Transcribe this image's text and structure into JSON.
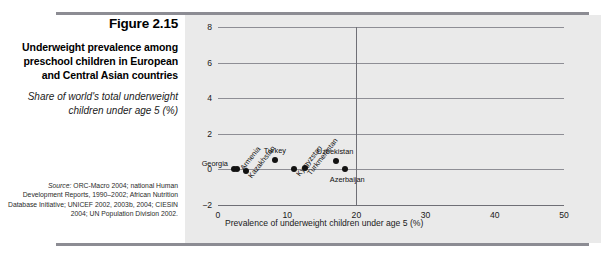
{
  "figure": {
    "number": "Figure 2.15",
    "title": "Underweight prevalence among preschool children in European and Central Asian countries",
    "subtitle": "Share of world's total underweight children under age 5 (%)",
    "source_lead": "Source:",
    "source_body": " ORC-Macro 2004; national Human Development Reports, 1990–2002; African Nutrition Database Initiative; UNICEF 2002, 2003b, 2004; CIESIN 2004; UN Population Division 2002."
  },
  "colors": {
    "rule": "#8c8c93",
    "panel_background": "#eaeaea",
    "page_background": "#ffffff",
    "gridline": "#8e8e95",
    "axis": "#6f6f76",
    "marker": "#111111"
  },
  "chart_data": {
    "type": "scatter",
    "title": "",
    "xlabel": "Prevalence of underweight children under age 5 (%)",
    "ylabel": "",
    "xlim": [
      0,
      50
    ],
    "ylim": [
      -2,
      8
    ],
    "xticks": [
      "0",
      "10",
      "20",
      "30",
      "40",
      "50"
    ],
    "yticks": [
      "8",
      "6",
      "4",
      "2",
      "0",
      "-2"
    ],
    "grid": true,
    "legend": "none",
    "reference_line_x": 20,
    "points": [
      {
        "label": "Georgia",
        "x": 2.3,
        "y": 0.0,
        "label_pos": "left",
        "rotation": 0
      },
      {
        "label": "Armenia",
        "x": 2.8,
        "y": 0.05,
        "label_pos": "diag-up",
        "rotation": -52
      },
      {
        "label": "Kazakhstan",
        "x": 4.0,
        "y": -0.1,
        "label_pos": "diag-down",
        "rotation": -52
      },
      {
        "label": "Turkey",
        "x": 8.3,
        "y": 0.55,
        "label_pos": "above",
        "rotation": 0
      },
      {
        "label": "Kyrgyzstan",
        "x": 11.0,
        "y": 0.0,
        "label_pos": "diag-down",
        "rotation": -52
      },
      {
        "label": "Turkmenistan",
        "x": 12.6,
        "y": 0.1,
        "label_pos": "diag-down",
        "rotation": -52
      },
      {
        "label": "Uzbekistan",
        "x": 17.1,
        "y": 0.45,
        "label_pos": "above",
        "rotation": 0
      },
      {
        "label": "Azerbaijan",
        "x": 18.4,
        "y": 0.0,
        "label_pos": "below",
        "rotation": 0
      }
    ]
  }
}
